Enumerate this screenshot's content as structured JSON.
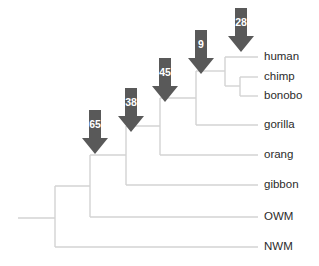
{
  "figure": {
    "type": "phylogenetic-cladogram",
    "background_color": "#ffffff",
    "branch_color": "#d3d3d3",
    "arrow_color": "#595959",
    "arrow_text_color": "#ffffff",
    "label_color": "#2b2b2b"
  },
  "tips": [
    {
      "id": "human",
      "label": "human",
      "y": 57,
      "label_x": 264
    },
    {
      "id": "chimp",
      "label": "chimp",
      "y": 77,
      "label_x": 264
    },
    {
      "id": "bonobo",
      "label": "bonobo",
      "y": 96,
      "label_x": 264
    },
    {
      "id": "gorilla",
      "label": "gorilla",
      "y": 125,
      "label_x": 264
    },
    {
      "id": "orang",
      "label": "orang",
      "y": 155,
      "label_x": 264
    },
    {
      "id": "gibbon",
      "label": "gibbon",
      "y": 185,
      "label_x": 264
    },
    {
      "id": "owm",
      "label": "OWM",
      "y": 217,
      "label_x": 264
    },
    {
      "id": "nwm",
      "label": "NWM",
      "y": 247,
      "label_x": 264
    }
  ],
  "nodes": [
    {
      "id": "node-chimp-bonobo",
      "x": 240,
      "child_top_y": 77,
      "child_bottom_y": 96
    },
    {
      "id": "node-human-panini",
      "x": 225,
      "child_top_y": 57,
      "child_bottom_y": 86
    },
    {
      "id": "node-gorilla-clade",
      "x": 196,
      "child_top_y": 71,
      "child_bottom_y": 125
    },
    {
      "id": "node-orang-clade",
      "x": 160,
      "child_top_y": 98,
      "child_bottom_y": 155
    },
    {
      "id": "node-gibbon-clade",
      "x": 126,
      "child_top_y": 126,
      "child_bottom_y": 185
    },
    {
      "id": "node-owm-clade",
      "x": 90,
      "child_top_y": 155,
      "child_bottom_y": 217
    },
    {
      "id": "node-root",
      "x": 55,
      "child_top_y": 186,
      "child_bottom_y": 247
    }
  ],
  "root_stem": {
    "x_start": 18,
    "x_end": 55,
    "y": 218
  },
  "tip_line_end_x": 258,
  "arrows": [
    {
      "id": "arrow-28",
      "value": "28",
      "x": 228,
      "y": 8,
      "target_node": "node-human-panini"
    },
    {
      "id": "arrow-9",
      "value": "9",
      "x": 188,
      "y": 30,
      "target_node": "node-gorilla-clade"
    },
    {
      "id": "arrow-45",
      "value": "45",
      "x": 152,
      "y": 58,
      "target_node": "node-orang-clade"
    },
    {
      "id": "arrow-38",
      "value": "38",
      "x": 118,
      "y": 88,
      "target_node": "node-gibbon-clade"
    },
    {
      "id": "arrow-65",
      "value": "65",
      "x": 82,
      "y": 110,
      "target_node": "node-owm-clade"
    }
  ],
  "chart_data": {
    "type": "tree",
    "title": "",
    "taxa": [
      "human",
      "chimp",
      "bonobo",
      "gorilla",
      "orang",
      "gibbon",
      "OWM",
      "NWM"
    ],
    "newick": "(NWM,(OWM,(gibbon,(orang,(gorilla,(human,(chimp,bonobo)))))));",
    "annotations": [
      {
        "label": "28",
        "clade": [
          "human",
          "chimp",
          "bonobo"
        ]
      },
      {
        "label": "9",
        "clade": [
          "human",
          "chimp",
          "bonobo",
          "gorilla"
        ]
      },
      {
        "label": "45",
        "clade": [
          "human",
          "chimp",
          "bonobo",
          "gorilla",
          "orang"
        ]
      },
      {
        "label": "38",
        "clade": [
          "human",
          "chimp",
          "bonobo",
          "gorilla",
          "orang",
          "gibbon"
        ]
      },
      {
        "label": "65",
        "clade": [
          "human",
          "chimp",
          "bonobo",
          "gorilla",
          "orang",
          "gibbon",
          "OWM"
        ]
      }
    ],
    "annotation_values": [
      28,
      9,
      45,
      38,
      65
    ],
    "annotation_unit": "",
    "legend": [],
    "grid": false
  }
}
